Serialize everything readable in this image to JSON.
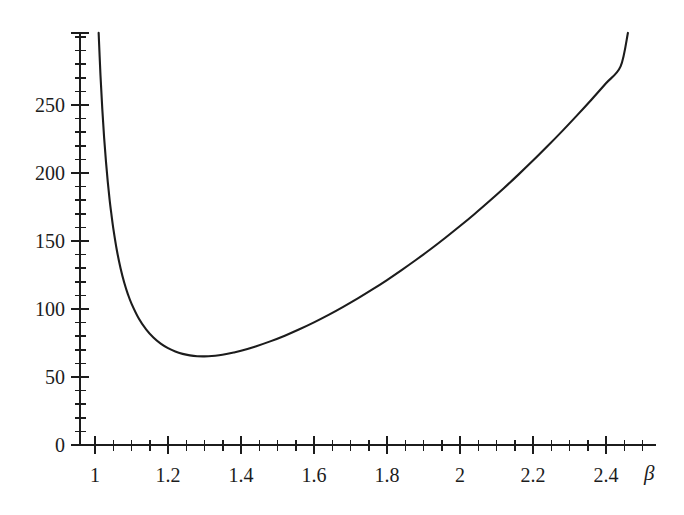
{
  "chart_data": {
    "type": "line",
    "title": "",
    "subtitle": "",
    "xlabel": "β",
    "ylabel": "",
    "xlim": [
      0.98,
      2.52
    ],
    "ylim": [
      0,
      305
    ],
    "grid": false,
    "legend": null,
    "axis_color": "#1c1c1c",
    "line_color": "#1c1c1c",
    "background_color": "#ffffff",
    "x_ticks_major": [
      {
        "value": 1,
        "label": "1"
      },
      {
        "value": 1.2,
        "label": "1.2"
      },
      {
        "value": 1.4,
        "label": "1.4"
      },
      {
        "value": 1.6,
        "label": "1.6"
      },
      {
        "value": 1.8,
        "label": "1.8"
      },
      {
        "value": 2.0,
        "label": "2"
      },
      {
        "value": 2.2,
        "label": "2.2"
      },
      {
        "value": 2.4,
        "label": "2.4"
      }
    ],
    "x_minor_step": 0.05,
    "y_ticks_major": [
      {
        "value": 0,
        "label": "0"
      },
      {
        "value": 50,
        "label": "50"
      },
      {
        "value": 100,
        "label": "100"
      },
      {
        "value": 150,
        "label": "150"
      },
      {
        "value": 200,
        "label": "200"
      },
      {
        "value": 250,
        "label": "250"
      }
    ],
    "y_minor_step": 10,
    "series": [
      {
        "name": "curve",
        "x": [
          1.01,
          1.015,
          1.02,
          1.025,
          1.03,
          1.035,
          1.04,
          1.045,
          1.05,
          1.06,
          1.07,
          1.08,
          1.09,
          1.1,
          1.12,
          1.14,
          1.16,
          1.18,
          1.2,
          1.22,
          1.24,
          1.26,
          1.28,
          1.3,
          1.32,
          1.34,
          1.36,
          1.38,
          1.4,
          1.44,
          1.48,
          1.52,
          1.56,
          1.6,
          1.64,
          1.68,
          1.72,
          1.76,
          1.8,
          1.84,
          1.88,
          1.92,
          1.96,
          2.0,
          2.04,
          2.08,
          2.12,
          2.16,
          2.2,
          2.24,
          2.28,
          2.32,
          2.36,
          2.4,
          2.44,
          2.46
        ],
        "y": [
          303.0,
          272.0,
          247.0,
          226.0,
          208.5,
          193.5,
          180.5,
          169.5,
          159.5,
          143.0,
          130.0,
          119.5,
          111.0,
          104.0,
          93.0,
          85.0,
          79.0,
          74.5,
          71.2,
          68.7,
          67.0,
          65.9,
          65.3,
          65.2,
          65.4,
          66.0,
          66.9,
          68.0,
          69.3,
          72.5,
          76.2,
          80.4,
          85.1,
          90.2,
          95.7,
          101.6,
          107.8,
          114.4,
          121.3,
          128.6,
          136.2,
          144.1,
          152.4,
          161.0,
          169.9,
          179.2,
          188.8,
          198.8,
          209.1,
          219.8,
          230.8,
          242.2,
          253.9,
          266.0,
          278.4,
          303.0
        ]
      }
    ],
    "annotations": []
  },
  "axes": {
    "x_axis_label": "β",
    "y_axis_label": ""
  }
}
